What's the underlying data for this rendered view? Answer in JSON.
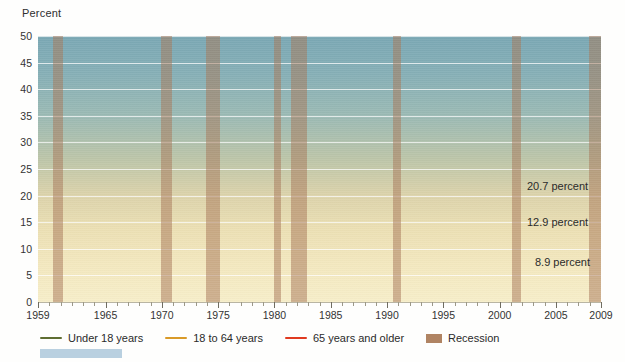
{
  "axis": {
    "y_title": "Percent",
    "y_ticks": [
      0,
      5,
      10,
      15,
      20,
      25,
      30,
      35,
      40,
      45,
      50
    ],
    "x_ticks_major": [
      1959,
      1965,
      1970,
      1975,
      1980,
      1985,
      1990,
      1995,
      2000,
      2005,
      2009
    ],
    "x_tick_labels": [
      "1959",
      "1965",
      "1970",
      "1975",
      "1980",
      "1985",
      "1990",
      "1995",
      "2000",
      "2005",
      "2009"
    ]
  },
  "legend": {
    "items": [
      {
        "label": "Under 18 years",
        "color": "#5f6e32",
        "kind": "line"
      },
      {
        "label": "18 to 64 years",
        "color": "#d99a28",
        "kind": "line"
      },
      {
        "label": "65 years and older",
        "color": "#e03a20",
        "kind": "line"
      },
      {
        "label": "Recession",
        "color": "#b08463",
        "kind": "box"
      }
    ]
  },
  "end_labels": [
    {
      "text": "20.7 percent",
      "series": "Under 18 years"
    },
    {
      "text": "12.9 percent",
      "series": "18 to 64 years"
    },
    {
      "text": "8.9 percent",
      "series": "65 years and older"
    }
  ],
  "chart_data": {
    "type": "line",
    "title": "",
    "xlabel": "",
    "ylabel": "Percent",
    "xlim": [
      1959,
      2009
    ],
    "ylim": [
      0,
      50
    ],
    "grid": true,
    "legend_position": "bottom-left",
    "annotations": [
      "20.7 percent",
      "12.9 percent",
      "8.9 percent"
    ],
    "recession_bands": [
      {
        "start": 1960.3,
        "end": 1961.2
      },
      {
        "start": 1969.9,
        "end": 1970.9
      },
      {
        "start": 1973.9,
        "end": 1975.2
      },
      {
        "start": 1980.0,
        "end": 1980.6
      },
      {
        "start": 1981.5,
        "end": 1982.9
      },
      {
        "start": 1990.5,
        "end": 1991.2
      },
      {
        "start": 2001.1,
        "end": 2001.9
      },
      {
        "start": 2007.9,
        "end": 2009.5
      }
    ],
    "series": [
      {
        "name": "Under 18 years",
        "color": "#5f6e32",
        "x": [
          1959,
          1960,
          1961,
          1962,
          1963,
          1964,
          1965,
          1966,
          1967,
          1968,
          1969,
          1970,
          1971,
          1972,
          1973,
          1974,
          1975,
          1976,
          1977,
          1978,
          1979,
          1980,
          1981,
          1982,
          1983,
          1984,
          1985,
          1986,
          1987,
          1988,
          1989,
          1990,
          1991,
          1992,
          1993,
          1994,
          1995,
          1996,
          1997,
          1998,
          1999,
          2000,
          2001,
          2002,
          2003,
          2004,
          2005,
          2006,
          2007,
          2008,
          2009
        ],
        "values": [
          27.3,
          26.9,
          25.6,
          25.0,
          23.1,
          23.0,
          21.0,
          17.6,
          16.6,
          15.6,
          14.0,
          15.1,
          15.3,
          15.1,
          14.4,
          15.4,
          17.1,
          16.0,
          16.2,
          15.9,
          16.4,
          18.3,
          20.0,
          21.9,
          22.3,
          21.5,
          20.7,
          20.5,
          20.3,
          19.5,
          19.6,
          20.6,
          21.8,
          22.3,
          22.7,
          21.8,
          20.8,
          20.5,
          19.9,
          18.9,
          17.1,
          16.2,
          16.3,
          16.7,
          17.6,
          17.8,
          17.6,
          17.4,
          18.0,
          19.0,
          20.7
        ]
      },
      {
        "name": "18 to 64 years",
        "color": "#d99a28",
        "x": [
          1959,
          1960,
          1961,
          1962,
          1963,
          1964,
          1965,
          1966,
          1967,
          1968,
          1969,
          1970,
          1971,
          1972,
          1973,
          1974,
          1975,
          1976,
          1977,
          1978,
          1979,
          1980,
          1981,
          1982,
          1983,
          1984,
          1985,
          1986,
          1987,
          1988,
          1989,
          1990,
          1991,
          1992,
          1993,
          1994,
          1995,
          1996,
          1997,
          1998,
          1999,
          2000,
          2001,
          2002,
          2003,
          2004,
          2005,
          2006,
          2007,
          2008,
          2009
        ],
        "values": [
          17.0,
          16.2,
          15.4,
          14.6,
          13.8,
          13.0,
          12.2,
          10.5,
          10.0,
          9.0,
          8.7,
          9.0,
          9.3,
          8.8,
          8.3,
          8.3,
          9.2,
          9.0,
          8.8,
          8.7,
          8.9,
          10.1,
          11.1,
          12.0,
          12.4,
          11.7,
          11.3,
          10.8,
          10.6,
          10.5,
          10.2,
          10.7,
          11.4,
          11.9,
          12.4,
          11.9,
          11.4,
          11.4,
          10.9,
          10.5,
          10.0,
          9.6,
          10.1,
          10.6,
          10.8,
          11.3,
          11.1,
          10.8,
          10.9,
          11.7,
          12.9
        ]
      },
      {
        "name": "65 years and older",
        "color": "#e03a20",
        "x": [
          1959,
          1960,
          1961,
          1962,
          1963,
          1964,
          1965,
          1966,
          1967,
          1968,
          1969,
          1970,
          1971,
          1972,
          1973,
          1974,
          1975,
          1976,
          1977,
          1978,
          1979,
          1980,
          1981,
          1982,
          1983,
          1984,
          1985,
          1986,
          1987,
          1988,
          1989,
          1990,
          1991,
          1992,
          1993,
          1994,
          1995,
          1996,
          1997,
          1998,
          1999,
          2000,
          2001,
          2002,
          2003,
          2004,
          2005,
          2006,
          2007,
          2008,
          2009
        ],
        "values": [
          35.2,
          34.3,
          33.4,
          32.5,
          31.7,
          30.8,
          29.9,
          29.5,
          26.0,
          25.0,
          25.3,
          24.6,
          21.6,
          18.6,
          16.3,
          15.7,
          15.3,
          15.0,
          14.1,
          14.0,
          15.2,
          15.7,
          15.3,
          14.6,
          13.8,
          12.4,
          12.6,
          12.4,
          12.5,
          12.0,
          11.4,
          12.2,
          12.4,
          12.9,
          12.2,
          11.7,
          10.5,
          10.8,
          10.5,
          10.5,
          9.7,
          9.9,
          10.1,
          10.4,
          10.2,
          9.8,
          10.1,
          9.4,
          9.7,
          9.7,
          8.9
        ]
      }
    ],
    "dotted_segments": [
      {
        "series": "65 years and older",
        "x_start": 1959,
        "x_end": 1966,
        "note": "interpolated"
      },
      {
        "series": "18 to 64 years",
        "x_start": 1959,
        "x_end": 1966,
        "note": "interpolated"
      }
    ]
  }
}
